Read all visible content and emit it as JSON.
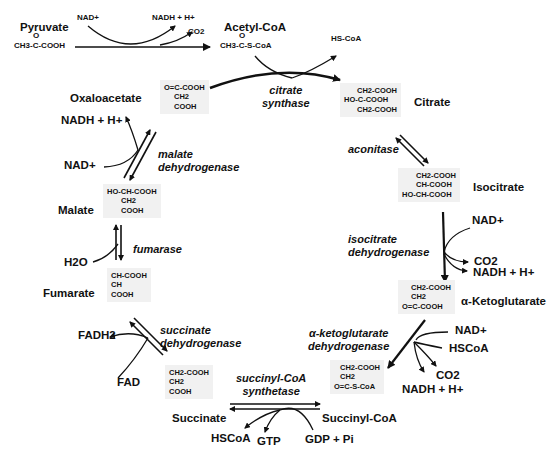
{
  "entry": {
    "pyruvate": {
      "name": "Pyruvate",
      "formula_top": "O",
      "formula": "CH3-C-COOH"
    },
    "acetyl_coa": {
      "name": "Acetyl-CoA",
      "formula_top": "O",
      "formula": "CH3-C-S-CoA"
    },
    "cofactors": {
      "nad": "NAD+",
      "nadh": "NADH + H+",
      "co2": "CO2"
    },
    "hs_coa": "HS-CoA"
  },
  "cycle": {
    "oxaloacetate": {
      "name": "Oxaloacetate",
      "structure": [
        "O=C-COOH",
        "CH2",
        "COOH"
      ]
    },
    "citrate": {
      "name": "Citrate",
      "structure": [
        "CH2-COOH",
        "HO-C-COOH",
        "CH2-COOH"
      ]
    },
    "isocitrate": {
      "name": "Isocitrate",
      "structure": [
        "CH2-COOH",
        "CH-COOH",
        "HO-CH-COOH"
      ]
    },
    "alpha_ketoglutarate": {
      "name": "α-Ketoglutarate",
      "structure": [
        "CH2-COOH",
        "CH2",
        "O=C-COOH"
      ]
    },
    "succinyl_coa": {
      "name": "Succinyl-CoA",
      "structure": [
        "CH2-COOH",
        "CH2",
        "O=C-S-CoA"
      ]
    },
    "succinate": {
      "name": "Succinate",
      "structure": [
        "CH2-COOH",
        "CH2",
        "COOH"
      ]
    },
    "fumarate": {
      "name": "Fumarate",
      "structure": [
        "CH-COOH",
        "CH",
        "COOH"
      ]
    },
    "malate": {
      "name": "Malate",
      "structure": [
        "HO-CH-COOH",
        "CH2",
        "COOH"
      ]
    }
  },
  "enzymes": {
    "citrate_synthase": [
      "citrate",
      "synthase"
    ],
    "aconitase": [
      "aconitase"
    ],
    "isocitrate_dehydrogenase": [
      "isocitrate",
      "dehydrogenase"
    ],
    "akg_dehydrogenase": [
      "α-ketoglutarate",
      "dehydrogenase"
    ],
    "succinyl_coa_synthetase": [
      "succinyl-CoA",
      "synthetase"
    ],
    "succinate_dehydrogenase": [
      "succinate",
      "dehydrogenase"
    ],
    "fumarase": [
      "fumarase"
    ],
    "malate_dehydrogenase": [
      "malate",
      "dehydrogenase"
    ]
  },
  "cofactors": {
    "idh_in": "NAD+",
    "idh_out_co2": "CO2",
    "idh_out_nadh": "NADH + H+",
    "akg_in_nad": "NAD+",
    "akg_in_hscoa": "HSCoA",
    "akg_out_co2": "CO2",
    "akg_out_nadh": "NADH + H+",
    "scs_out_hscoa": "HSCoA",
    "scs_out_gtp": "GTP",
    "scs_in_gdp": "GDP + Pi",
    "sdh_in_fad": "FAD",
    "sdh_out_fadh2": "FADH2",
    "fum_in_h2o": "H2O",
    "mdh_in_nad": "NAD+",
    "mdh_out_nadh": "NADH + H+"
  }
}
